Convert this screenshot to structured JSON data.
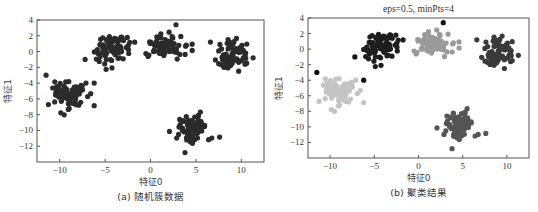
{
  "chart_data": [
    {
      "type": "scatter",
      "id": "a",
      "title": "",
      "caption": "(a) 随机簇数据",
      "xlabel": "特征0",
      "ylabel": "特征1",
      "xlim": [
        -12.5,
        12.5
      ],
      "ylim": [
        -14,
        4
      ],
      "xticks": [
        -10,
        -5,
        0,
        5,
        10
      ],
      "yticks": [
        4,
        2,
        0,
        -2,
        -4,
        -6,
        -8,
        -10,
        -12
      ],
      "grid": false,
      "legend": null,
      "frame": {
        "left": 37,
        "top": 20,
        "right": 264,
        "bottom": 162
      },
      "series": [
        {
          "name": "cluster-1",
          "center": [
            -9,
            -5.5
          ],
          "spread": [
            0.9,
            0.9
          ],
          "count": 80,
          "color": "#2b2b2b"
        },
        {
          "name": "cluster-2",
          "center": [
            -4.2,
            0.3
          ],
          "spread": [
            0.95,
            0.9
          ],
          "count": 80,
          "color": "#2b2b2b"
        },
        {
          "name": "cluster-3",
          "center": [
            1.5,
            0.7
          ],
          "spread": [
            1.0,
            0.75
          ],
          "count": 80,
          "color": "#2b2b2b"
        },
        {
          "name": "cluster-4",
          "center": [
            9.0,
            -0.6
          ],
          "spread": [
            0.85,
            0.9
          ],
          "count": 80,
          "color": "#2b2b2b"
        },
        {
          "name": "cluster-5",
          "center": [
            4.8,
            -9.6
          ],
          "spread": [
            0.9,
            0.9
          ],
          "count": 80,
          "color": "#2b2b2b"
        }
      ],
      "outliers": [
        {
          "x": -11.5,
          "y": -3.0,
          "color": "#2b2b2b"
        },
        {
          "x": -6.2,
          "y": -4.0,
          "color": "#2b2b2b"
        },
        {
          "x": 2.8,
          "y": 3.4,
          "color": "#2b2b2b"
        },
        {
          "x": -7.2,
          "y": -1.0,
          "color": "#2b2b2b"
        },
        {
          "x": 3.8,
          "y": -12.8,
          "color": "#2b2b2b"
        },
        {
          "x": 6.6,
          "y": 1.2,
          "color": "#2b2b2b"
        },
        {
          "x": 11.3,
          "y": -0.8,
          "color": "#2b2b2b"
        }
      ]
    },
    {
      "type": "scatter",
      "id": "b",
      "title": "eps=0.5, minPts=4",
      "caption": "(b) 聚类结果",
      "xlabel": "特征0",
      "ylabel": "特征1",
      "xlim": [
        -12.5,
        12.5
      ],
      "ylim": [
        -14,
        4
      ],
      "xticks": [
        -10,
        -5,
        0,
        5,
        10
      ],
      "yticks": [
        4,
        2,
        0,
        -2,
        -4,
        -6,
        -8,
        -10,
        -12
      ],
      "grid": false,
      "legend": null,
      "frame": {
        "left": 40,
        "top": 18,
        "right": 261,
        "bottom": 158
      },
      "series": [
        {
          "name": "cluster-1",
          "center": [
            -9,
            -5.5
          ],
          "spread": [
            0.9,
            0.9
          ],
          "count": 80,
          "color": "#c4c4c4"
        },
        {
          "name": "cluster-2",
          "center": [
            -4.2,
            0.3
          ],
          "spread": [
            0.95,
            0.9
          ],
          "count": 80,
          "color": "#1e1e1e"
        },
        {
          "name": "cluster-3",
          "center": [
            1.5,
            0.7
          ],
          "spread": [
            1.0,
            0.75
          ],
          "count": 80,
          "color": "#9a9a9a"
        },
        {
          "name": "cluster-4",
          "center": [
            9.0,
            -0.6
          ],
          "spread": [
            0.85,
            0.9
          ],
          "count": 80,
          "color": "#3a3a3a"
        },
        {
          "name": "cluster-5",
          "center": [
            4.8,
            -9.6
          ],
          "spread": [
            0.9,
            0.9
          ],
          "count": 80,
          "color": "#555555"
        }
      ],
      "outliers": [
        {
          "x": -11.5,
          "y": -3.0,
          "color": "#111111"
        },
        {
          "x": -6.2,
          "y": -4.0,
          "color": "#111111"
        },
        {
          "x": 2.8,
          "y": 3.4,
          "color": "#111111"
        },
        {
          "x": -7.2,
          "y": -1.0,
          "color": "#111111"
        },
        {
          "x": 3.8,
          "y": -12.8,
          "color": "#555555"
        },
        {
          "x": 6.6,
          "y": 1.2,
          "color": "#3a3a3a"
        },
        {
          "x": 11.3,
          "y": -0.8,
          "color": "#3a3a3a"
        }
      ]
    }
  ],
  "style": {
    "marker_radius": 2.6,
    "axis_color": "#555555",
    "seed": 7
  }
}
